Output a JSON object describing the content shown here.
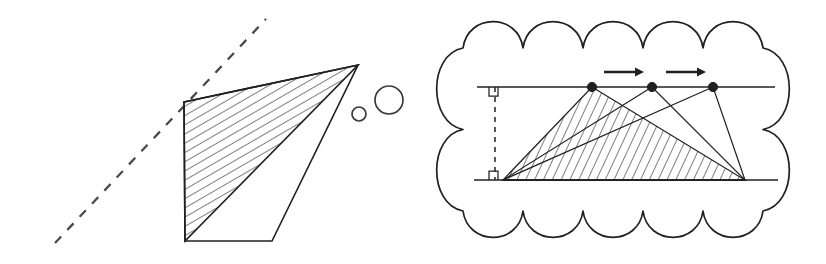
{
  "figure": {
    "background_color": "#ffffff",
    "ink_color": "#231f20",
    "width": 826,
    "height": 264
  },
  "left_panel": {
    "name": "hatched quadrilateral with dashed ray",
    "dashed_ray": {
      "label": "dashed construction line",
      "x1": 55,
      "y1": 243,
      "x2": 266,
      "y2": 19,
      "dash_pattern": "9 9",
      "color": "#4a4a4a"
    },
    "outer_quadrilateral": {
      "label": "outer quadrilateral outline",
      "points": "184,102 358,65 272,241 185,241"
    },
    "shaded_triangle": {
      "label": "hatched region",
      "points": "184,102 358,65 185,241",
      "hatch_angle_deg": 60,
      "hatch_spacing": 8
    },
    "small_circle": {
      "label": "small open circle",
      "cx": 359,
      "cy": 114,
      "r": 7
    },
    "large_circle": {
      "label": "large open circle",
      "cx": 389,
      "cy": 100,
      "r": 14
    }
  },
  "right_panel": {
    "name": "thought cloud containing sliding-apex triangles",
    "cloud": {
      "label": "thought bubble outline",
      "bumps_top": 5,
      "bumps_bottom": 5,
      "bounds": {
        "x": 437,
        "y": 22,
        "width": 352,
        "height": 215
      }
    },
    "top_line": {
      "label": "upper parallel line",
      "x1": 477,
      "y1": 87,
      "x2": 775,
      "y2": 87
    },
    "bottom_line": {
      "label": "lower parallel line",
      "x1": 474,
      "y1": 180,
      "x2": 778,
      "y2": 180
    },
    "height_segment": {
      "label": "dashed perpendicular height between the parallels",
      "x": 495,
      "y1": 87,
      "y2": 180,
      "dash_pattern": "5 5"
    },
    "right_angle_marks": [
      {
        "label": "right angle at top line",
        "x": 489,
        "y": 87,
        "size": 9
      },
      {
        "label": "right angle at bottom line",
        "x": 489,
        "y": 180,
        "size": 9
      }
    ],
    "base": {
      "label": "common base of all three triangles",
      "left": {
        "x": 503,
        "y": 180
      },
      "right": {
        "x": 745,
        "y": 180
      }
    },
    "apex_points": [
      {
        "label": "apex 1",
        "x": 592,
        "y": 87
      },
      {
        "label": "apex 2",
        "x": 652,
        "y": 87
      },
      {
        "label": "apex 3",
        "x": 713,
        "y": 87
      }
    ],
    "shaded_triangle": {
      "label": "hatched triangle with apex 1",
      "points": "503,180 745,180 592,87",
      "hatch_angle_deg": 25,
      "hatch_spacing": 8
    },
    "outline_triangles": [
      {
        "label": "triangle with apex 2",
        "points": "503,180 745,180 652,87"
      },
      {
        "label": "triangle with apex 3",
        "points": "503,180 745,180 713,87"
      }
    ],
    "motion_arrows": [
      {
        "label": "arrow from apex 1 to apex 2",
        "x1": 604,
        "x2": 644,
        "y": 72
      },
      {
        "label": "arrow from apex 2 to apex 3",
        "x1": 666,
        "x2": 706,
        "y": 72
      }
    ]
  }
}
